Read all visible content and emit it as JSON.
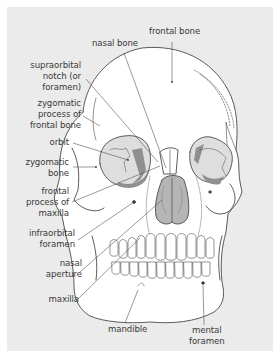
{
  "diagram": {
    "colors": {
      "panel_bg": "#ebebeb",
      "bone_fill": "#ffffff",
      "outline": "#4a4a4a",
      "cavity_light": "#dcdcdc",
      "cavity_dark": "#8f8f8f",
      "leader_line": "#555555"
    },
    "labels": [
      {
        "id": "nasal-bone",
        "lines": [
          "nasal bone"
        ]
      },
      {
        "id": "frontal-bone",
        "lines": [
          "frontal bone"
        ]
      },
      {
        "id": "supraorbital-notch",
        "lines": [
          "supraorbital",
          "notch (or",
          "foramen)"
        ]
      },
      {
        "id": "zygomatic-process",
        "lines": [
          "zygomatic",
          "process of",
          "frontal bone"
        ]
      },
      {
        "id": "orbit",
        "lines": [
          "orbit"
        ]
      },
      {
        "id": "zygomatic-bone",
        "lines": [
          "zygomatic",
          "bone"
        ]
      },
      {
        "id": "frontal-process-maxilla",
        "lines": [
          "frontal",
          "process of",
          "maxilla"
        ]
      },
      {
        "id": "infraorbital-foramen",
        "lines": [
          "infraorbital",
          "foramen"
        ]
      },
      {
        "id": "nasal-aperture",
        "lines": [
          "nasal",
          "aperture"
        ]
      },
      {
        "id": "maxilla",
        "lines": [
          "maxilla"
        ]
      },
      {
        "id": "mandible",
        "lines": [
          "mandible"
        ]
      },
      {
        "id": "mental-foramen",
        "lines": [
          "mental",
          "foramen"
        ]
      }
    ]
  }
}
